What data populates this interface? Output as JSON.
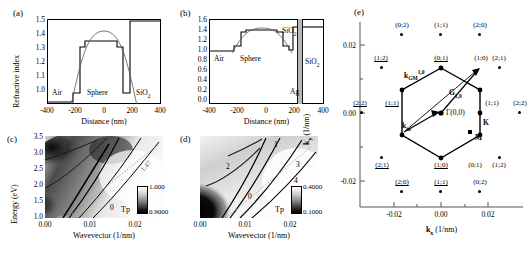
{
  "figure": {
    "panels": [
      "(a)",
      "(b)",
      "(c)",
      "(d)",
      "(e)"
    ]
  },
  "panel_a": {
    "tag": "(a)",
    "xlabel": "Distance (nm)",
    "ylabel": "Refractive index",
    "xticks": [
      "-400",
      "-200",
      "0",
      "200",
      "400"
    ],
    "yticks": [
      "1.0",
      "1.1",
      "1.2",
      "1.3",
      "1.4",
      "1.5"
    ],
    "region_labels": [
      "Air",
      "Sphere",
      "SiO"
    ],
    "sio2_sub": "2",
    "xlim": [
      -480,
      480
    ],
    "ylim": [
      0.97,
      1.56
    ]
  },
  "panel_b": {
    "tag": "(b)",
    "xlabel": "Distance (nm)",
    "xticks": [
      "-400",
      "-200",
      "0",
      "200",
      "400"
    ],
    "yticks": [
      "0.0",
      "0.2",
      "0.4",
      "0.6",
      "0.8",
      "1.0",
      "1.2",
      "1.4",
      "1.6"
    ],
    "region_labels": [
      "Air",
      "Sphere",
      "SiO",
      "Ag",
      "SiO"
    ],
    "sio2_sub": "2",
    "xlim": [
      -480,
      480
    ],
    "ylim": [
      0.0,
      1.68
    ]
  },
  "panel_c": {
    "tag": "(c)",
    "xlabel": "Wavevector (1/nm)",
    "ylabel": "Energy (eV)",
    "xticks": [
      "0.00",
      "0.01",
      "0.02"
    ],
    "yticks": [
      "1.0",
      "1.5",
      "2.0",
      "2.5",
      "3.0",
      "3.5"
    ],
    "contour_labels": [
      "2",
      "1",
      "0"
    ],
    "light_line_label": "1.47",
    "colorbar": {
      "title": "Tp",
      "max": "1.000",
      "min": "0.9000"
    },
    "xlim": [
      0.0,
      0.026
    ],
    "ylim": [
      1.0,
      3.75
    ]
  },
  "panel_d": {
    "tag": "(d)",
    "xlabel": "Wavevector (1/nm)",
    "xticks": [
      "0.00",
      "0.01",
      "0.02"
    ],
    "contour_labels": [
      "0",
      "1",
      "2",
      "3",
      "4"
    ],
    "colorbar": {
      "title": "Tp",
      "max": "0.4000",
      "min": "0.1000"
    },
    "xlim": [
      0.0,
      0.026
    ],
    "ylim": [
      1.0,
      3.75
    ]
  },
  "panel_e": {
    "tag": "(e)",
    "xlabel": "k",
    "xlabel_sub": "x",
    "xlabel_unit": " (1/nm)",
    "ylabel": "k",
    "ylabel_sub": "y",
    "ylabel_unit": " (1/nm)",
    "xticks": [
      "-0.02",
      "0.00",
      "0.02"
    ],
    "yticks": [
      "0.02",
      "0.00",
      "-0.02"
    ],
    "origin_label": "Γ(0,0)",
    "vectors": [
      {
        "name": "k_GM",
        "label": "k",
        "sub": "GM",
        "sup": "1,0"
      },
      {
        "name": "G_10",
        "label": "G",
        "sub": "1,0"
      },
      {
        "name": "k_in",
        "label": "k",
        "sub": "in"
      }
    ],
    "sym_points": [
      "K",
      "M"
    ],
    "lattice_points": [
      {
        "label": "(0;2)",
        "ul": [
          false,
          false
        ]
      },
      {
        "label": "(1;1)",
        "ul": [
          false,
          false
        ]
      },
      {
        "label": "(2;0)",
        "ul": [
          false,
          false
        ]
      },
      {
        "label": "(1;2)",
        "ul": [
          true,
          false
        ]
      },
      {
        "label": "(0;1)",
        "ul": [
          true,
          true
        ]
      },
      {
        "label": "(1;0)",
        "ul": [
          false,
          false
        ]
      },
      {
        "label": "(2;1)",
        "ul": [
          false,
          false
        ]
      },
      {
        "label": "(2;2)",
        "ul": [
          true,
          false
        ]
      },
      {
        "label": "(1;1)",
        "ul": [
          true,
          true
        ]
      },
      {
        "label": "(1;1)",
        "ul": [
          false,
          false
        ]
      },
      {
        "label": "(2;2)",
        "ul": [
          false,
          false
        ]
      },
      {
        "label": "(2;1)",
        "ul": [
          true,
          true
        ]
      },
      {
        "label": "(1;0)",
        "ul": [
          true,
          true
        ]
      },
      {
        "label": "(0;1)",
        "ul": [
          false,
          false
        ]
      },
      {
        "label": "(1;2)",
        "ul": [
          false,
          false
        ]
      },
      {
        "label": "(2;0)",
        "ul": [
          true,
          true
        ]
      },
      {
        "label": "(1;1)",
        "ul": [
          true,
          false
        ]
      },
      {
        "label": "(0;2)",
        "ul": [
          false,
          false
        ]
      }
    ],
    "xlim": [
      -0.032,
      0.032
    ],
    "ylim": [
      -0.032,
      0.032
    ]
  }
}
